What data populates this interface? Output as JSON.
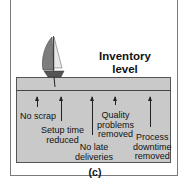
{
  "diagram": {
    "title": "Inventory level",
    "title_lines": [
      "Inventory",
      "level"
    ],
    "caption": "(c)",
    "metaphor": "sailboat floating on water (inventory level) above rocks (problems)",
    "labels": [
      {
        "id": "no-scrap",
        "lines": [
          "No scrap"
        ]
      },
      {
        "id": "setup-time",
        "lines": [
          "Setup time",
          "reduced"
        ]
      },
      {
        "id": "no-late",
        "lines": [
          "No late",
          "deliveries"
        ]
      },
      {
        "id": "quality",
        "lines": [
          "Quality",
          "problems",
          "removed"
        ]
      },
      {
        "id": "downtime",
        "lines": [
          "Process",
          "downtime",
          "removed"
        ]
      }
    ],
    "colors": {
      "water": "#c9c9c9",
      "sail": "#7d7d7d",
      "hull": "#555555",
      "frame": "#7a7a7a"
    }
  }
}
